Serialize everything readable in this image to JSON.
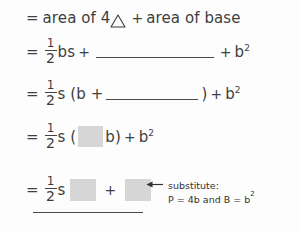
{
  "document": {
    "type": "handwritten-style math worksheet",
    "background_color": "#fdfdfd",
    "ink_color": "#3d3d3d",
    "highlight_box_color": "#d6d6d6"
  },
  "lines": [
    {
      "id": "line1",
      "relation": "=",
      "text_a": "area of 4",
      "icon": "triangle-icon",
      "operator": "+",
      "text_b": "area of base"
    },
    {
      "id": "line2",
      "relation": "=",
      "fraction": {
        "numerator": "1",
        "denominator": "2"
      },
      "term_a": "bs",
      "operator_a": "+",
      "blank": "blank-rule",
      "operator_b": "+",
      "term_b": "b",
      "term_b_exponent": "2"
    },
    {
      "id": "line3",
      "relation": "=",
      "fraction": {
        "numerator": "1",
        "denominator": "2"
      },
      "term_a": "s (b +",
      "blank": "blank-rule",
      "term_b": ")",
      "operator_b": "+",
      "term_c": "b",
      "term_c_exponent": "2"
    },
    {
      "id": "line4",
      "relation": "=",
      "fraction": {
        "numerator": "1",
        "denominator": "2"
      },
      "term_a": "s (",
      "box": "gray-box",
      "term_b": "b)",
      "operator_b": "+",
      "term_c": "b",
      "term_c_exponent": "2"
    },
    {
      "id": "line5",
      "relation": "=",
      "fraction": {
        "numerator": "1",
        "denominator": "2"
      },
      "term_a": "s",
      "box_1": "gray-box",
      "operator": "+",
      "box_2": "gray-box"
    }
  ],
  "annotation": {
    "arrow": "←",
    "label": "substitute:",
    "detail_prefix": "P = 4b and B = b",
    "detail_exponent": "2"
  }
}
